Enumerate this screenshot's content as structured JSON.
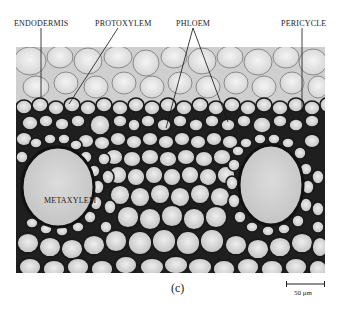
{
  "figure": {
    "panel_label": "(c)",
    "labels": {
      "endodermis": "ENDODERMIS",
      "protoxylem": "PROTOXYLEM",
      "phloem": "PHLOEM",
      "pericycle": "PERICYCLE",
      "metaxylem": "METAXYLEM"
    },
    "scale_bar": {
      "text": "50 μm"
    },
    "colors": {
      "background": "#ffffff",
      "cell_wall": "#1c1c1c",
      "cell_lumen": "#d6d6d6",
      "cortex_cells": "#e8e8e8",
      "metaxylem_lumen": "#cfcfcf",
      "leader_line": "#111111"
    }
  }
}
